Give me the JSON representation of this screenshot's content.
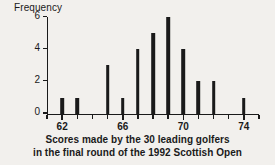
{
  "chart_data": {
    "type": "bar",
    "title": "",
    "subtitle": "",
    "xlabel": "Scores made by the 30 leading golfers in the final round of the 1992 Scottish Open",
    "ylabel": "Frequency",
    "categories": [
      62,
      63,
      64,
      65,
      66,
      67,
      68,
      69,
      70,
      71,
      72,
      73,
      74
    ],
    "values": [
      1,
      1,
      0,
      3,
      1,
      4,
      5,
      6,
      4,
      2,
      2,
      0,
      1
    ],
    "xlim": [
      61,
      75
    ],
    "ylim": [
      0,
      6
    ],
    "xticks": [
      61,
      62,
      63,
      64,
      65,
      66,
      67,
      68,
      69,
      70,
      71,
      72,
      73,
      74,
      75
    ],
    "xticklabels_shown": [
      62,
      66,
      70,
      74
    ],
    "yticks": [
      0,
      2,
      4,
      6
    ],
    "grid": false,
    "legend": false,
    "bar_color": "#1a1a1a",
    "total_count": 30
  },
  "axes": {
    "y_title": "Frequency",
    "y_tick_labels": [
      "0",
      "2",
      "4",
      "6"
    ],
    "x_tick_labels": [
      "62",
      "66",
      "70",
      "74"
    ]
  },
  "caption": {
    "line1": "Scores made by the 30 leading golfers",
    "line2": "in the final round of the 1992 Scottish Open"
  },
  "colors": {
    "background": "#f2f0ed",
    "ink": "#1a1a1a"
  }
}
